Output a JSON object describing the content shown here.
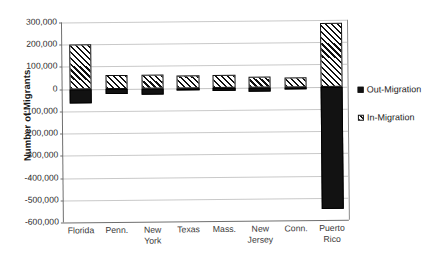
{
  "chart_data": {
    "type": "bar",
    "title": "",
    "subtitle": "",
    "xlabel": "",
    "ylabel": "Number of Migrants",
    "categories": [
      "Florida",
      "Penn.",
      "New\nYork",
      "Texas",
      "Mass.",
      "New\nJersey",
      "Conn.",
      "Puerto\nRico"
    ],
    "series": [
      {
        "name": "In-Migration",
        "values": [
          200000,
          60000,
          60000,
          55000,
          55000,
          50000,
          45000,
          285000
        ]
      },
      {
        "name": "Out-Migration",
        "values": [
          -65000,
          -25000,
          -30000,
          -10000,
          -15000,
          -18000,
          -8000,
          -550000
        ]
      }
    ],
    "ylim": [
      -600000,
      300000
    ],
    "ytick_labels": [
      "300,000",
      "200,000",
      "100,000",
      "0",
      "-100,000",
      "-200,000",
      "-300,000",
      "-400,000",
      "-500,000",
      "-600,000"
    ],
    "ytick_values": [
      300000,
      200000,
      100000,
      0,
      -100000,
      -200000,
      -300000,
      -400000,
      -500000,
      -600000
    ],
    "grid": true,
    "legend_position": "right",
    "stacked": true
  },
  "legend": {
    "entries": [
      {
        "label": "Out-Migration",
        "pattern": "solid-dotted-black"
      },
      {
        "label": "In-Migration",
        "pattern": "diagonal-hatch"
      }
    ]
  }
}
